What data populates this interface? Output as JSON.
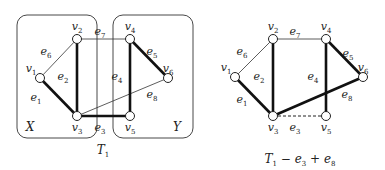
{
  "left_graph": {
    "caption": "T",
    "caption_sub": "1",
    "sets": [
      {
        "name": "X",
        "x": 17,
        "y": 15,
        "w": 80,
        "h": 123
      },
      {
        "name": "Y",
        "x": 113,
        "y": 15,
        "w": 80,
        "h": 123
      }
    ],
    "vertices": [
      {
        "id": "v1",
        "label": "v",
        "sub": "1",
        "x": 40,
        "y": 78
      },
      {
        "id": "v2",
        "label": "v",
        "sub": "2",
        "x": 77,
        "y": 39
      },
      {
        "id": "v3",
        "label": "v",
        "sub": "3",
        "x": 77,
        "y": 116
      },
      {
        "id": "v4",
        "label": "v",
        "sub": "4",
        "x": 130,
        "y": 39
      },
      {
        "id": "v5",
        "label": "v",
        "sub": "5",
        "x": 130,
        "y": 116
      },
      {
        "id": "v6",
        "label": "v",
        "sub": "6",
        "x": 168,
        "y": 78
      }
    ],
    "edges": [
      {
        "id": "e1",
        "from": "v1",
        "to": "v3",
        "style": "thick"
      },
      {
        "id": "e2",
        "from": "v2",
        "to": "v3",
        "style": "thick"
      },
      {
        "id": "e3",
        "from": "v3",
        "to": "v5",
        "style": "thick"
      },
      {
        "id": "e4",
        "from": "v4",
        "to": "v5",
        "style": "thick"
      },
      {
        "id": "e5",
        "from": "v4",
        "to": "v6",
        "style": "thick"
      },
      {
        "id": "e6",
        "from": "v1",
        "to": "v2",
        "style": "thin"
      },
      {
        "id": "e7",
        "from": "v2",
        "to": "v4",
        "style": "thin"
      },
      {
        "id": "e8",
        "from": "v3",
        "to": "v6",
        "style": "thin"
      }
    ]
  },
  "right_graph": {
    "caption": "T",
    "caption_sub": "1",
    "caption_rest_1": " − e",
    "caption_rest_1_sub": "3",
    "caption_rest_2": " + e",
    "caption_rest_2_sub": "8",
    "vertices": [
      {
        "id": "v1",
        "label": "v",
        "sub": "1",
        "x": 235,
        "y": 77
      },
      {
        "id": "v2",
        "label": "v",
        "sub": "2",
        "x": 273,
        "y": 39
      },
      {
        "id": "v3",
        "label": "v",
        "sub": "3",
        "x": 273,
        "y": 116
      },
      {
        "id": "v4",
        "label": "v",
        "sub": "4",
        "x": 326,
        "y": 39
      },
      {
        "id": "v5",
        "label": "v",
        "sub": "5",
        "x": 326,
        "y": 116
      },
      {
        "id": "v6",
        "label": "v",
        "sub": "6",
        "x": 363,
        "y": 77
      }
    ],
    "edges": [
      {
        "id": "e1",
        "from": "v1",
        "to": "v3",
        "style": "thick"
      },
      {
        "id": "e2",
        "from": "v2",
        "to": "v3",
        "style": "thick"
      },
      {
        "id": "e3",
        "from": "v3",
        "to": "v5",
        "style": "dashed"
      },
      {
        "id": "e4",
        "from": "v4",
        "to": "v5",
        "style": "thick"
      },
      {
        "id": "e5",
        "from": "v4",
        "to": "v6",
        "style": "thick"
      },
      {
        "id": "e6",
        "from": "v1",
        "to": "v2",
        "style": "thin"
      },
      {
        "id": "e7",
        "from": "v2",
        "to": "v4",
        "style": "thin"
      },
      {
        "id": "e8",
        "from": "v3",
        "to": "v6",
        "style": "thick"
      }
    ]
  },
  "edge_label_positions": {
    "left": {
      "e1": [
        36,
        101
      ],
      "e2": [
        63,
        80
      ],
      "e3": [
        100,
        131
      ],
      "e4": [
        117,
        80
      ],
      "e5": [
        152,
        55
      ],
      "e6": [
        46,
        55
      ],
      "e7": [
        100,
        35
      ],
      "e8": [
        152,
        98
      ]
    },
    "right": {
      "e1": [
        242,
        103
      ],
      "e2": [
        259,
        80
      ],
      "e3": [
        295,
        131
      ],
      "e4": [
        313,
        80
      ],
      "e5": [
        348,
        57
      ],
      "e6": [
        242,
        55
      ],
      "e7": [
        295,
        35
      ],
      "e8": [
        347,
        98
      ]
    }
  },
  "vertex_label_offsets": {
    "v1": [
      -9,
      -6
    ],
    "v2": [
      0,
      -9
    ],
    "v3": [
      0,
      15
    ],
    "v4": [
      0,
      -9
    ],
    "v5": [
      0,
      15
    ],
    "v6": [
      0,
      -6
    ]
  },
  "set_label_positions": {
    "X": [
      30,
      131
    ],
    "Y": [
      177,
      131
    ]
  },
  "caption_positions": {
    "left": [
      103,
      154
    ],
    "right": [
      300,
      163
    ]
  },
  "colors": {
    "stroke": "#111111",
    "node_fill": "#ffffff",
    "background": "#ffffff"
  }
}
